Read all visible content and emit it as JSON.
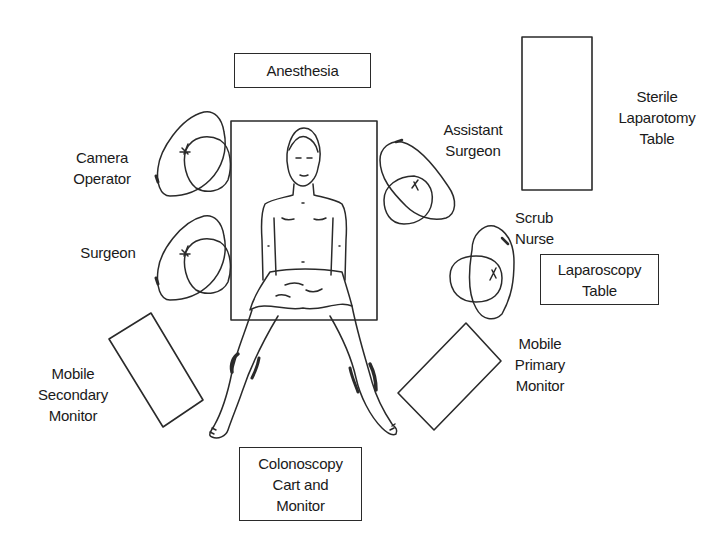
{
  "diagram": {
    "type": "operating-room-layout",
    "stroke_color": "#2a2a2a",
    "background": "#ffffff",
    "equipment": [
      {
        "id": "anesthesia",
        "lines": [
          "Anesthesia"
        ]
      },
      {
        "id": "sterile_laparotomy_table",
        "lines": [
          "Sterile",
          "Laparotomy",
          "Table"
        ]
      },
      {
        "id": "laparoscopy_table",
        "lines": [
          "Laparoscopy",
          "Table"
        ]
      },
      {
        "id": "colonoscopy_cart",
        "lines": [
          "Colonoscopy",
          "Cart and",
          "Monitor"
        ]
      },
      {
        "id": "mobile_secondary_monitor",
        "lines": [
          "Mobile",
          "Secondary",
          "Monitor"
        ]
      },
      {
        "id": "mobile_primary_monitor",
        "lines": [
          "Mobile",
          "Primary",
          "Monitor"
        ]
      },
      {
        "id": "operating_table",
        "lines": []
      }
    ],
    "personnel": [
      {
        "id": "camera_operator",
        "lines": [
          "Camera",
          "Operator"
        ]
      },
      {
        "id": "surgeon",
        "lines": [
          "Surgeon"
        ]
      },
      {
        "id": "assistant_surgeon",
        "lines": [
          "Assistant",
          "Surgeon"
        ]
      },
      {
        "id": "scrub_nurse",
        "lines": [
          "Scrub",
          "Nurse"
        ]
      }
    ],
    "patient": {
      "position": "supine, legs abducted in stirrups"
    }
  }
}
